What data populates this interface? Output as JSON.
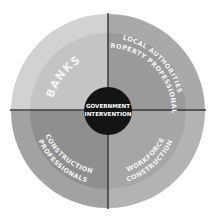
{
  "diagram": {
    "title": "Government Intervention",
    "center": {
      "line1": "GOVERNMENT",
      "line2": "INTERVENTION",
      "fill": "#141414",
      "text_color": "#ffffff"
    },
    "quadrants": [
      {
        "id": "top-left",
        "label_lines": [
          "BANKS"
        ],
        "body_text": "",
        "body_text_note": "illegible",
        "outer_fill": "#d2d2d2",
        "inner_fill": "#c4c4c4"
      },
      {
        "id": "top-right",
        "label_lines": [
          "LOCAL AUTHORITIES",
          "PROPERTY PROFESSIONALS"
        ],
        "body_text": "",
        "body_text_note": "illegible",
        "outer_fill": "#a9a9a9",
        "inner_fill": "#9a9a9a"
      },
      {
        "id": "bottom-left",
        "label_lines": [
          "CONSTRUCTION",
          "PROFESSIONALS"
        ],
        "body_text": "",
        "body_text_note": "illegible",
        "outer_fill": "#a2a2a2",
        "inner_fill": "#8f8f8f"
      },
      {
        "id": "bottom-right",
        "label_lines": [
          "CONSTRUCTION",
          "WORKFORCE"
        ],
        "body_text": "",
        "body_text_note": "illegible",
        "outer_fill": "#b3b3b3",
        "inner_fill": "#a6a6a6"
      }
    ],
    "divider_color": "#3a3a3a",
    "label_color": "#f4f4f4"
  }
}
